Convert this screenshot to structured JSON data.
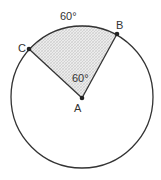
{
  "diagram": {
    "type": "circle-sector",
    "center_label": "A",
    "points": [
      {
        "label": "A",
        "role": "center"
      },
      {
        "label": "B",
        "role": "point-on-circle"
      },
      {
        "label": "C",
        "role": "point-on-circle"
      }
    ],
    "arc_label": "60°",
    "central_angle_label": "60°",
    "shaded_region": "sector CAB",
    "colors": {
      "stroke": "#333333",
      "shade": "#d9d9d9",
      "point": "#222222"
    }
  }
}
